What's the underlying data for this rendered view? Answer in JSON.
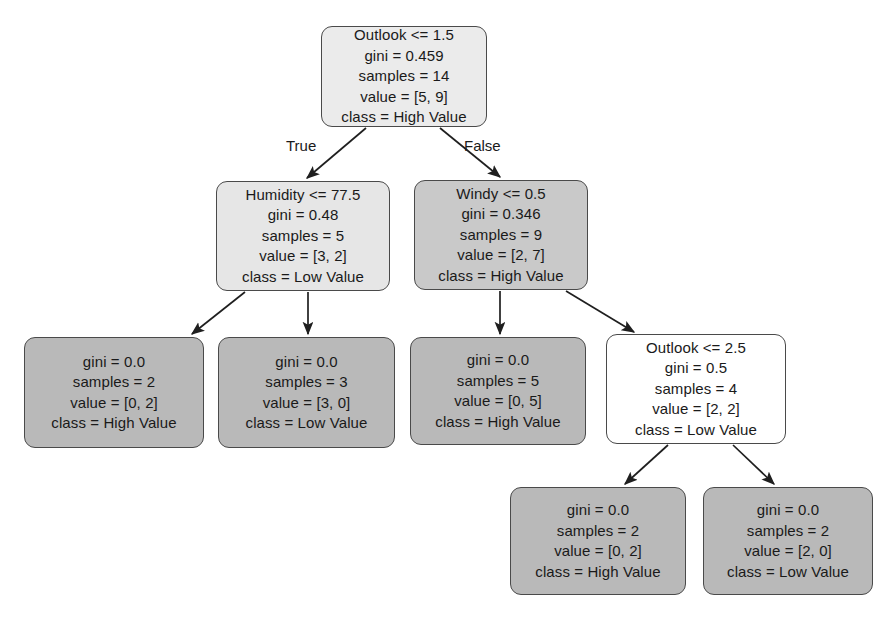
{
  "diagram": {
    "type": "decision-tree",
    "background_color": "#ffffff",
    "border_color": "#4a4a4a",
    "text_color": "#1a1a1a"
  },
  "edge_labels": {
    "true": "True",
    "false": "False"
  },
  "nodes": [
    {
      "id": "root",
      "kind": "internal",
      "fill": "#ebebeb",
      "x": 321,
      "y": 26,
      "w": 166,
      "h": 101,
      "lines": [
        "Outlook <= 1.5",
        "gini = 0.459",
        "samples = 14",
        "value = [5, 9]",
        "class = High Value"
      ]
    },
    {
      "id": "humidity",
      "kind": "internal",
      "fill": "#e6e6e6",
      "x": 216,
      "y": 181,
      "w": 174,
      "h": 110,
      "lines": [
        "Humidity <= 77.5",
        "gini = 0.48",
        "samples = 5",
        "value = [3, 2]",
        "class = Low Value"
      ]
    },
    {
      "id": "windy",
      "kind": "internal",
      "fill": "#c9c9c9",
      "x": 414,
      "y": 180,
      "w": 174,
      "h": 110,
      "lines": [
        "Windy <= 0.5",
        "gini = 0.346",
        "samples = 9",
        "value = [2, 7]",
        "class = High Value"
      ]
    },
    {
      "id": "leaf-a",
      "kind": "leaf",
      "fill": "#b9b9b9",
      "x": 24,
      "y": 337,
      "w": 180,
      "h": 111,
      "lines": [
        "gini = 0.0",
        "samples = 2",
        "value = [0, 2]",
        "class = High Value"
      ]
    },
    {
      "id": "leaf-b",
      "kind": "leaf",
      "fill": "#b9b9b9",
      "x": 218,
      "y": 337,
      "w": 177,
      "h": 111,
      "lines": [
        "gini = 0.0",
        "samples = 3",
        "value = [3, 0]",
        "class = Low Value"
      ]
    },
    {
      "id": "leaf-c",
      "kind": "leaf",
      "fill": "#b9b9b9",
      "x": 410,
      "y": 337,
      "w": 176,
      "h": 108,
      "lines": [
        "gini = 0.0",
        "samples = 5",
        "value = [0, 5]",
        "class = High Value"
      ]
    },
    {
      "id": "outlook2",
      "kind": "internal",
      "fill": "#ffffff",
      "x": 606,
      "y": 334,
      "w": 180,
      "h": 110,
      "lines": [
        "Outlook <= 2.5",
        "gini = 0.5",
        "samples = 4",
        "value = [2, 2]",
        "class = Low Value"
      ]
    },
    {
      "id": "leaf-d",
      "kind": "leaf",
      "fill": "#b9b9b9",
      "x": 510,
      "y": 487,
      "w": 176,
      "h": 108,
      "lines": [
        "gini = 0.0",
        "samples = 2",
        "value = [0, 2]",
        "class = High Value"
      ]
    },
    {
      "id": "leaf-e",
      "kind": "leaf",
      "fill": "#b9b9b9",
      "x": 703,
      "y": 487,
      "w": 170,
      "h": 108,
      "lines": [
        "gini = 0.0",
        "samples = 2",
        "value = [2, 0]",
        "class = Low Value"
      ]
    }
  ],
  "edges": [
    {
      "from": "root",
      "to": "humidity",
      "x1": 366,
      "y1": 128,
      "x2": 307,
      "y2": 178,
      "label": "True",
      "label_x": 286,
      "label_y": 137
    },
    {
      "from": "root",
      "to": "windy",
      "x1": 440,
      "y1": 128,
      "x2": 500,
      "y2": 177,
      "label": "False",
      "label_x": 464,
      "label_y": 137
    },
    {
      "from": "humidity",
      "to": "leaf-a",
      "x1": 245,
      "y1": 292,
      "x2": 192,
      "y2": 334,
      "label": "",
      "label_x": 0,
      "label_y": 0
    },
    {
      "from": "humidity",
      "to": "leaf-b",
      "x1": 308,
      "y1": 292,
      "x2": 308,
      "y2": 334,
      "label": "",
      "label_x": 0,
      "label_y": 0
    },
    {
      "from": "windy",
      "to": "leaf-c",
      "x1": 500,
      "y1": 291,
      "x2": 500,
      "y2": 334,
      "label": "",
      "label_x": 0,
      "label_y": 0
    },
    {
      "from": "windy",
      "to": "outlook2",
      "x1": 566,
      "y1": 291,
      "x2": 634,
      "y2": 332,
      "label": "",
      "label_x": 0,
      "label_y": 0
    },
    {
      "from": "outlook2",
      "to": "leaf-d",
      "x1": 668,
      "y1": 445,
      "x2": 625,
      "y2": 484,
      "label": "",
      "label_x": 0,
      "label_y": 0
    },
    {
      "from": "outlook2",
      "to": "leaf-e",
      "x1": 733,
      "y1": 445,
      "x2": 774,
      "y2": 484,
      "label": "",
      "label_x": 0,
      "label_y": 0
    }
  ]
}
